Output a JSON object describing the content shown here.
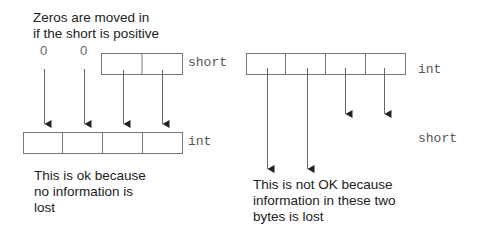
{
  "left": {
    "caption_top": "Zeros are moved in\nif the short is positive",
    "zero_labels": [
      "0",
      "0"
    ],
    "source_label": "short",
    "target_label": "int",
    "caption_bottom": "This is ok because\nno information is\nlost"
  },
  "right": {
    "source_label": "int",
    "target_label": "short",
    "caption_bottom": "This is not OK because\ninformation in these two\nbytes is lost"
  },
  "colors": {
    "stroke": "#666666",
    "text": "#222222"
  }
}
